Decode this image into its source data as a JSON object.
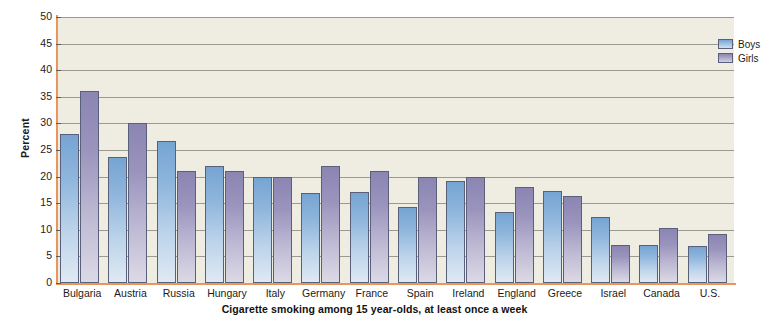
{
  "chart_data": {
    "type": "bar",
    "title": "Cigarette smoking among 15 year-olds, at least once a week",
    "xlabel": "",
    "ylabel": "Percent",
    "ylim": [
      0,
      50
    ],
    "yticks": [
      0,
      5,
      10,
      15,
      20,
      25,
      30,
      35,
      40,
      45,
      50
    ],
    "grid": true,
    "legend_position": "top-right",
    "categories": [
      "Bulgaria",
      "Austria",
      "Russia",
      "Hungary",
      "Italy",
      "Germany",
      "France",
      "Spain",
      "Ireland",
      "England",
      "Greece",
      "Israel",
      "Canada",
      "U.S."
    ],
    "series": [
      {
        "name": "Boys",
        "color": "#76a4d2",
        "values": [
          28,
          23.7,
          26.7,
          22,
          20,
          17,
          17.2,
          14.3,
          19.2,
          13.3,
          17.3,
          12.4,
          7.2,
          7
        ]
      },
      {
        "name": "Girls",
        "color": "#8a85b2",
        "values": [
          36,
          30,
          21,
          21,
          20,
          22,
          21,
          20,
          20,
          18,
          16.3,
          7.2,
          10.3,
          9.3
        ]
      }
    ]
  },
  "legend": {
    "items": [
      {
        "label": "Boys",
        "swatch": "boys"
      },
      {
        "label": "Girls",
        "swatch": "girls"
      }
    ]
  },
  "colors": {
    "plot_background": "#efece1",
    "axis_line": "#e8965c",
    "gridline": "#9a9a93",
    "boys_bar": "#76a4d2",
    "girls_bar": "#8a85b2",
    "bar_border": "#5a5f7a"
  },
  "source_note": ""
}
